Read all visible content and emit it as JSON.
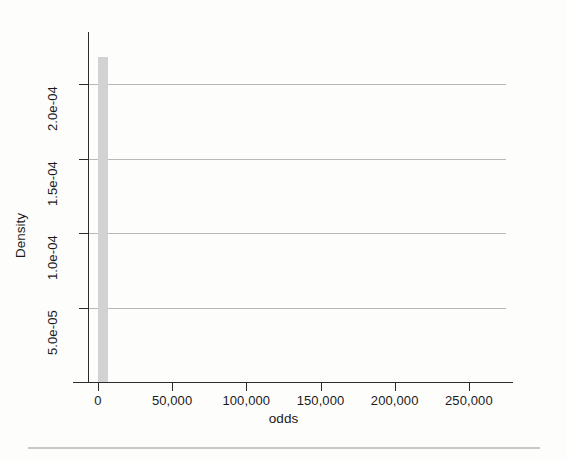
{
  "chart_data": {
    "type": "bar",
    "title": "",
    "subtitle": "",
    "xlabel": "odds",
    "ylabel": "Density",
    "xlim": [
      -6000,
      275000
    ],
    "ylim": [
      0,
      0.000235
    ],
    "grid": true,
    "legend": null,
    "annotations": [],
    "x_ticks": [
      {
        "value": 0,
        "label": "0"
      },
      {
        "value": 50000,
        "label": "50,000"
      },
      {
        "value": 100000,
        "label": "100,000"
      },
      {
        "value": 150000,
        "label": "150,000"
      },
      {
        "value": 200000,
        "label": "200,000"
      },
      {
        "value": 250000,
        "label": "250,000"
      }
    ],
    "y_ticks": [
      {
        "value": 5e-05,
        "label": "5.0e-05"
      },
      {
        "value": 0.0001,
        "label": "1.0e-04"
      },
      {
        "value": 0.00015,
        "label": "1.5e-04"
      },
      {
        "value": 0.0002,
        "label": "2.0e-04"
      }
    ],
    "bar_color": "#d2d2d2",
    "bars": [
      {
        "x_start": 0,
        "x_end": 7000,
        "height": 0.000218,
        "label": "0-7,000"
      }
    ]
  },
  "axes": {
    "x_title": "odds",
    "y_title": "Density"
  },
  "colors": {
    "axis": "#2b2b2b",
    "grid": "#b9b9b9",
    "bar": "#d2d2d2",
    "rule": "#c8c8c8",
    "background": "#fdfdfc"
  }
}
